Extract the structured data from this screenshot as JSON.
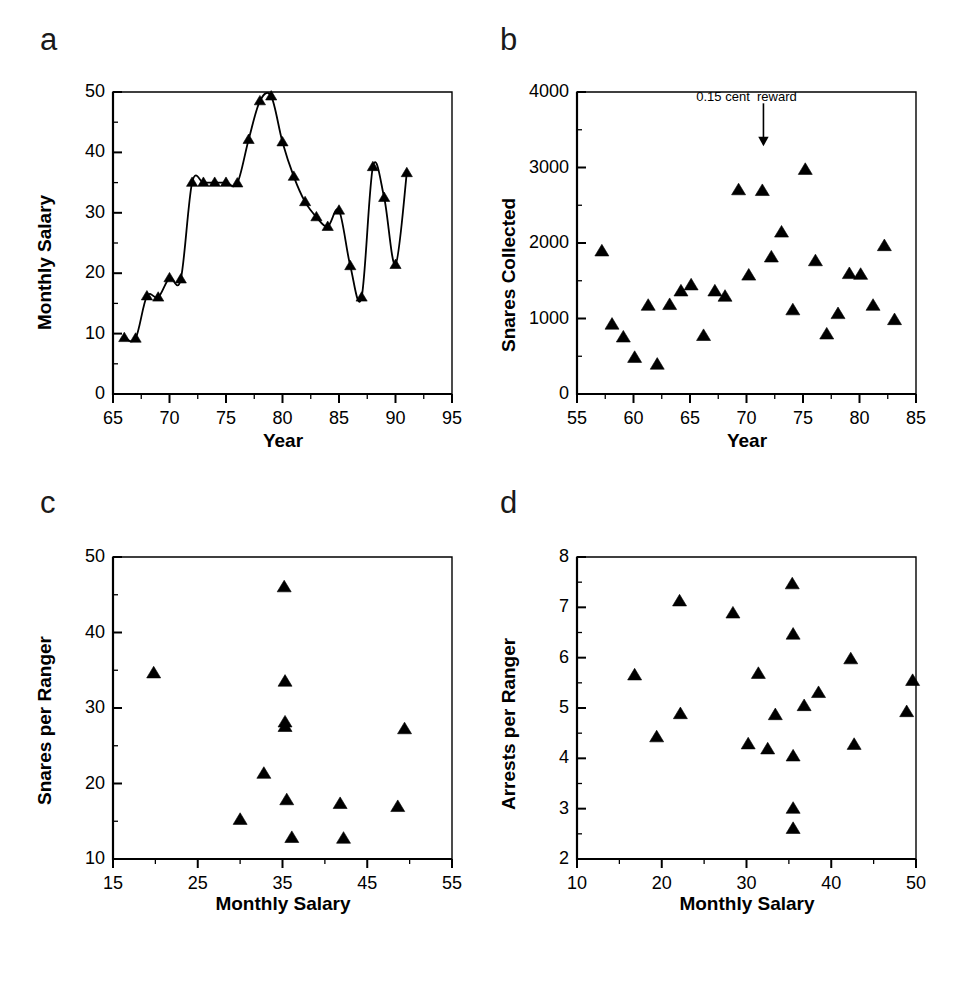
{
  "figure": {
    "background": "#ffffff",
    "marker_color": "#000000",
    "line_color": "#000000",
    "panels": [
      "a",
      "b",
      "c",
      "d"
    ]
  },
  "chart_data": [
    {
      "panel": "a",
      "type": "line",
      "title": "",
      "xlabel": "Year",
      "ylabel": "Monthly Salary",
      "xlim": [
        65,
        95
      ],
      "ylim": [
        0,
        50
      ],
      "xticks": [
        65,
        70,
        75,
        80,
        85,
        90,
        95
      ],
      "yticks": [
        0,
        10,
        20,
        30,
        40,
        50
      ],
      "xminor_step": 2.5,
      "yminor_step": 5,
      "grid": false,
      "legend": "none",
      "marker": "triangle-up",
      "x": [
        66,
        67,
        68,
        69,
        70,
        71,
        72,
        73,
        74,
        75,
        76,
        77,
        78,
        79,
        80,
        81,
        82,
        83,
        84,
        85,
        86,
        87,
        88,
        89,
        90,
        91
      ],
      "y": [
        9.3,
        9.2,
        16.2,
        16.0,
        19.2,
        19.0,
        35.0,
        35.0,
        35.0,
        35.0,
        34.9,
        42.1,
        48.5,
        49.3,
        41.7,
        36.0,
        31.8,
        29.3,
        27.7,
        30.4,
        21.2,
        16.0,
        37.6,
        32.5,
        21.4,
        36.6
      ]
    },
    {
      "panel": "b",
      "type": "scatter",
      "title": "",
      "xlabel": "Year",
      "ylabel": "Snares Collected",
      "xlim": [
        55,
        85
      ],
      "ylim": [
        0,
        4000
      ],
      "xticks": [
        55,
        60,
        65,
        70,
        75,
        80,
        85
      ],
      "yticks": [
        0,
        1000,
        2000,
        3000,
        4000
      ],
      "xminor_step": 2.5,
      "yminor_step": 500,
      "grid": false,
      "legend": "none",
      "marker": "triangle-up",
      "annotation": {
        "text": "0.15 cent  reward",
        "arrow_x": 71.5,
        "arrow_y_top": 3850,
        "arrow_y_tip": 3280,
        "text_x": 70.0,
        "text_y": 3930
      },
      "points": [
        {
          "x": 57.2,
          "y": 1890
        },
        {
          "x": 58.1,
          "y": 920
        },
        {
          "x": 59.1,
          "y": 750
        },
        {
          "x": 60.1,
          "y": 480
        },
        {
          "x": 61.3,
          "y": 1170
        },
        {
          "x": 62.1,
          "y": 390
        },
        {
          "x": 63.2,
          "y": 1180
        },
        {
          "x": 64.2,
          "y": 1360
        },
        {
          "x": 65.1,
          "y": 1440
        },
        {
          "x": 66.2,
          "y": 770
        },
        {
          "x": 67.2,
          "y": 1360
        },
        {
          "x": 68.1,
          "y": 1290
        },
        {
          "x": 69.3,
          "y": 2700
        },
        {
          "x": 70.2,
          "y": 1570
        },
        {
          "x": 71.4,
          "y": 2690
        },
        {
          "x": 72.2,
          "y": 1810
        },
        {
          "x": 73.1,
          "y": 2140
        },
        {
          "x": 74.1,
          "y": 1110
        },
        {
          "x": 75.2,
          "y": 2970
        },
        {
          "x": 76.1,
          "y": 1760
        },
        {
          "x": 77.1,
          "y": 790
        },
        {
          "x": 78.1,
          "y": 1060
        },
        {
          "x": 79.1,
          "y": 1590
        },
        {
          "x": 80.1,
          "y": 1580
        },
        {
          "x": 81.2,
          "y": 1170
        },
        {
          "x": 82.2,
          "y": 1960
        },
        {
          "x": 83.1,
          "y": 980
        }
      ]
    },
    {
      "panel": "c",
      "type": "scatter",
      "title": "",
      "xlabel": "Monthly Salary",
      "ylabel": "Snares per Ranger",
      "xlim": [
        15,
        55
      ],
      "ylim": [
        10,
        50
      ],
      "xticks": [
        15,
        25,
        35,
        45,
        55
      ],
      "yticks": [
        10,
        20,
        30,
        40,
        50
      ],
      "xminor_step": 5,
      "yminor_step": 5,
      "grid": false,
      "legend": "none",
      "marker": "triangle-up",
      "points": [
        {
          "x": 19.8,
          "y": 34.6
        },
        {
          "x": 30.0,
          "y": 15.2
        },
        {
          "x": 32.8,
          "y": 21.3
        },
        {
          "x": 35.2,
          "y": 46.0
        },
        {
          "x": 35.3,
          "y": 33.5
        },
        {
          "x": 35.3,
          "y": 28.1
        },
        {
          "x": 35.3,
          "y": 27.5
        },
        {
          "x": 35.5,
          "y": 17.8
        },
        {
          "x": 36.1,
          "y": 12.8
        },
        {
          "x": 41.8,
          "y": 17.3
        },
        {
          "x": 42.2,
          "y": 12.7
        },
        {
          "x": 48.6,
          "y": 16.9
        },
        {
          "x": 49.4,
          "y": 27.2
        }
      ]
    },
    {
      "panel": "d",
      "type": "scatter",
      "title": "",
      "xlabel": "Monthly Salary",
      "ylabel": "Arrests per Ranger",
      "xlim": [
        10,
        50
      ],
      "ylim": [
        2,
        8
      ],
      "xticks": [
        10,
        20,
        30,
        40,
        50
      ],
      "yticks": [
        2,
        3,
        4,
        5,
        6,
        7,
        8
      ],
      "xminor_step": 5,
      "yminor_step": 0.5,
      "grid": false,
      "legend": "none",
      "marker": "triangle-up",
      "points": [
        {
          "x": 16.8,
          "y": 5.65
        },
        {
          "x": 19.4,
          "y": 4.42
        },
        {
          "x": 22.1,
          "y": 7.12
        },
        {
          "x": 22.2,
          "y": 4.88
        },
        {
          "x": 28.4,
          "y": 6.88
        },
        {
          "x": 30.2,
          "y": 4.28
        },
        {
          "x": 31.4,
          "y": 5.68
        },
        {
          "x": 32.5,
          "y": 4.18
        },
        {
          "x": 33.4,
          "y": 4.86
        },
        {
          "x": 35.4,
          "y": 7.46
        },
        {
          "x": 35.5,
          "y": 6.46
        },
        {
          "x": 35.5,
          "y": 4.04
        },
        {
          "x": 35.5,
          "y": 3.0
        },
        {
          "x": 35.5,
          "y": 2.6
        },
        {
          "x": 36.8,
          "y": 5.04
        },
        {
          "x": 38.5,
          "y": 5.3
        },
        {
          "x": 42.3,
          "y": 5.97
        },
        {
          "x": 42.7,
          "y": 4.27
        },
        {
          "x": 48.9,
          "y": 4.92
        },
        {
          "x": 49.6,
          "y": 5.54
        }
      ]
    }
  ]
}
